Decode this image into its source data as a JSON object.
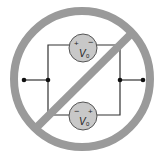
{
  "diagram": {
    "top_source": {
      "label": "V",
      "subscript": "0",
      "plus": "+",
      "minus": "−",
      "polarity": "plus-left"
    },
    "bottom_source": {
      "label": "V",
      "subscript": "0",
      "plus": "+",
      "minus": "−",
      "polarity": "minus-left"
    },
    "colors": {
      "prohibition": "#9a9a9a",
      "source_fill": "#c8c8c8",
      "wire": "#333333",
      "node": "#111111"
    }
  }
}
